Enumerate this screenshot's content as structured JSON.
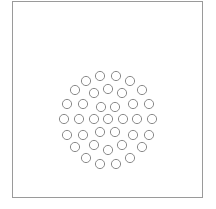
{
  "diagram": {
    "type": "circle-packing",
    "stroke_color": "#8a8a8a",
    "frame_color": "#9a9a9a",
    "circle_radius": 4.6,
    "circle_count": 42,
    "circles": [
      [
        100,
        76
      ],
      [
        116,
        76
      ],
      [
        86,
        81
      ],
      [
        130,
        81
      ],
      [
        75,
        90
      ],
      [
        108,
        89
      ],
      [
        142,
        90
      ],
      [
        94,
        93
      ],
      [
        122,
        93
      ],
      [
        67,
        104
      ],
      [
        83,
        104
      ],
      [
        133,
        104
      ],
      [
        149,
        104
      ],
      [
        101,
        107
      ],
      [
        115,
        107
      ],
      [
        64,
        119
      ],
      [
        79,
        119
      ],
      [
        94,
        119
      ],
      [
        108,
        119
      ],
      [
        123,
        119
      ],
      [
        137,
        119
      ],
      [
        152,
        119
      ],
      [
        67,
        135
      ],
      [
        83,
        135
      ],
      [
        100,
        132
      ],
      [
        115,
        132
      ],
      [
        133,
        135
      ],
      [
        149,
        135
      ],
      [
        75,
        147
      ],
      [
        94,
        145
      ],
      [
        108,
        150
      ],
      [
        122,
        145
      ],
      [
        142,
        147
      ],
      [
        86,
        158
      ],
      [
        130,
        158
      ],
      [
        100,
        164
      ],
      [
        116,
        164
      ]
    ]
  }
}
